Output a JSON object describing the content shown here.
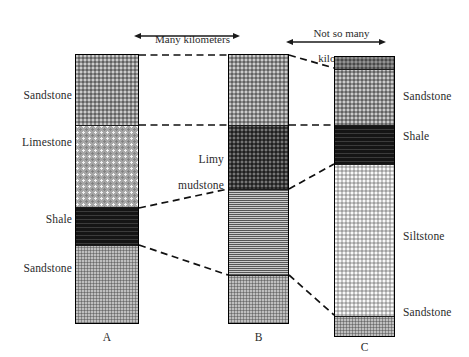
{
  "figure": {
    "type": "stratigraphic-correlation-diagram",
    "background_color": "#ffffff",
    "outline_color": "#000000",
    "correlation_line_style": "dashed"
  },
  "scale_annotations": [
    {
      "id": "many-kilometers",
      "line1": "Many kilometers",
      "line2": "",
      "arrow": "double-headed-horizontal"
    },
    {
      "id": "not-so-many-kilometers",
      "line1": "Not so many",
      "line2": "kilometers",
      "arrow": "double-headed-horizontal"
    }
  ],
  "columns": [
    {
      "id": "column-a",
      "letter": "A",
      "label_side": "left",
      "layers": [
        {
          "name": "Sandstone",
          "lithology": "sandstone",
          "label": "Sandstone",
          "show_label": true
        },
        {
          "name": "Limestone",
          "lithology": "limestone",
          "label": "Limestone",
          "show_label": true
        },
        {
          "name": "Shale",
          "lithology": "shale",
          "label": "Shale",
          "show_label": true
        },
        {
          "name": "Sandstone",
          "lithology": "sandstone2",
          "label": "Sandstone",
          "show_label": true
        }
      ]
    },
    {
      "id": "column-b",
      "letter": "B",
      "label_side": "left",
      "layers": [
        {
          "name": "Sandstone",
          "lithology": "sandstone",
          "label": "",
          "show_label": false
        },
        {
          "name": "Limy mudstone",
          "lithology": "limy-mudstone",
          "label": "Limy\nmudstone",
          "show_label": true
        },
        {
          "name": "Mudstone",
          "lithology": "mudstone-laminated",
          "label": "",
          "show_label": false
        },
        {
          "name": "Sandstone",
          "lithology": "sandstone2",
          "label": "",
          "show_label": false
        }
      ]
    },
    {
      "id": "column-c",
      "letter": "C",
      "label_side": "right",
      "layers": [
        {
          "name": "Cap bed",
          "lithology": "dark-cap",
          "label": "",
          "show_label": false
        },
        {
          "name": "Sandstone",
          "lithology": "sandstone",
          "label": "Sandstone",
          "show_label": true
        },
        {
          "name": "Shale",
          "lithology": "shale",
          "label": "Shale",
          "show_label": true
        },
        {
          "name": "Siltstone",
          "lithology": "siltstone",
          "label": "Siltstone",
          "show_label": true
        },
        {
          "name": "Sandstone",
          "lithology": "sandstone2",
          "label": "Sandstone",
          "show_label": true
        }
      ]
    }
  ],
  "labels": {
    "a_sandstone_top": "Sandstone",
    "a_limestone": "Limestone",
    "a_shale": "Shale",
    "a_sandstone_bottom": "Sandstone",
    "b_limy_mudstone_l1": "Limy",
    "b_limy_mudstone_l2": "mudstone",
    "c_sandstone_top": "Sandstone",
    "c_shale": "Shale",
    "c_siltstone": "Siltstone",
    "c_sandstone_bottom": "Sandstone",
    "letter_a": "A",
    "letter_b": "B",
    "letter_c": "C",
    "scale_many_l1": "Many kilometers",
    "scale_not_so_many_l1": "Not so many",
    "scale_not_so_many_l2": "kilometers"
  }
}
